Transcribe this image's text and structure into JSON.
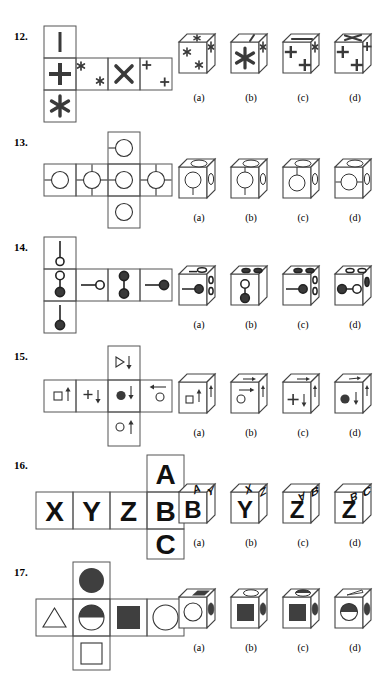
{
  "page": {
    "width": 383,
    "height": 688,
    "background": "#ffffff",
    "ink": "#1a1a1a",
    "gray": "#555555",
    "fill": "#444444"
  },
  "option_labels": [
    "(a)",
    "(b)",
    "(c)",
    "(d)"
  ],
  "problems": [
    {
      "number": "12.",
      "num_x": 14,
      "num_y": 30,
      "net": {
        "x": 44,
        "y": 26,
        "cell": 32,
        "cells": [
          {
            "col": 0,
            "row": 0,
            "glyph": "vertical-bar"
          },
          {
            "col": 0,
            "row": 1,
            "glyph": "plus-bold"
          },
          {
            "col": 0,
            "row": 2,
            "glyph": "asterisk-bold"
          },
          {
            "col": 1,
            "row": 1,
            "glyph": "two-small-asterisks"
          },
          {
            "col": 2,
            "row": 1,
            "glyph": "big-x"
          },
          {
            "col": 3,
            "row": 1,
            "glyph": "two-small-plus"
          }
        ]
      },
      "options": [
        {
          "label": "(a)",
          "x": 175,
          "y": 30,
          "front": "asterisk-pair",
          "top": "small-asterisk",
          "side": "small-asterisk"
        },
        {
          "label": "(b)",
          "x": 227,
          "y": 30,
          "front": "big-asterisk",
          "top": "bar",
          "side": "small-asterisk"
        },
        {
          "label": "(c)",
          "x": 279,
          "y": 30,
          "front": "plus-pair",
          "top": "bar-horizontal",
          "side": "small-asterisk"
        },
        {
          "label": "(d)",
          "x": 331,
          "y": 30,
          "front": "plus-pair",
          "top": "big-x",
          "side": "small-plus"
        }
      ],
      "label_y": 92
    },
    {
      "number": "13.",
      "num_x": 14,
      "num_y": 136,
      "net": {
        "x": 44,
        "y": 132,
        "cell": 32,
        "cells": [
          {
            "col": 2,
            "row": 0,
            "glyph": "circle-left-stub"
          },
          {
            "col": 0,
            "row": 1,
            "glyph": "circle-left-stub"
          },
          {
            "col": 1,
            "row": 1,
            "glyph": "circle-four-stubs"
          },
          {
            "col": 2,
            "row": 1,
            "glyph": "circle-left-stub"
          },
          {
            "col": 3,
            "row": 1,
            "glyph": "circle-four-stubs"
          },
          {
            "col": 2,
            "row": 2,
            "glyph": "circle-plain"
          }
        ],
        "shifted": true
      },
      "options": [
        {
          "label": "(a)",
          "x": 175,
          "y": 155,
          "front": "circle-down-stub",
          "top": "ellipse",
          "side": "ellipse"
        },
        {
          "label": "(b)",
          "x": 227,
          "y": 155,
          "front": "circle-up-down-stub",
          "top": "ellipse",
          "side": "ellipse"
        },
        {
          "label": "(c)",
          "x": 279,
          "y": 155,
          "front": "circle-up-stub",
          "top": "ellipse",
          "side": "ellipse"
        },
        {
          "label": "(d)",
          "x": 331,
          "y": 155,
          "front": "circle-left-right-stub",
          "top": "ellipse",
          "side": "ellipse"
        }
      ],
      "label_y": 212
    },
    {
      "number": "14.",
      "num_x": 14,
      "num_y": 241,
      "net": {
        "x": 44,
        "y": 237,
        "cell": 32,
        "cells": [
          {
            "col": 0,
            "row": 0,
            "glyph": "line-down-open-circle"
          },
          {
            "col": 0,
            "row": 1,
            "glyph": "open-above-filled"
          },
          {
            "col": 1,
            "row": 1,
            "glyph": "line-left-open-circle"
          },
          {
            "col": 2,
            "row": 1,
            "glyph": "filled-above-filled"
          },
          {
            "col": 3,
            "row": 1,
            "glyph": "line-left-filled-circle"
          },
          {
            "col": 0,
            "row": 2,
            "glyph": "line-down-filled-circle"
          }
        ]
      },
      "options": [
        {
          "label": "(a)",
          "x": 175,
          "y": 262,
          "front": "line-filled-right",
          "top": "one-open",
          "side": "two-ellipse"
        },
        {
          "label": "(b)",
          "x": 227,
          "y": 262,
          "front": "open-above-filled-v",
          "top": "two-filled",
          "side": "blank"
        },
        {
          "label": "(c)",
          "x": 279,
          "y": 262,
          "front": "line-filled-right",
          "top": "two-filled",
          "side": "two-ellipse"
        },
        {
          "label": "(d)",
          "x": 331,
          "y": 262,
          "front": "filled-line-open",
          "top": "two-open",
          "side": "one-ellipse"
        }
      ],
      "label_y": 319
    },
    {
      "number": "15.",
      "num_x": 14,
      "num_y": 350,
      "net": {
        "x": 44,
        "y": 346,
        "cell": 32,
        "cells": [
          {
            "col": 2,
            "row": 0,
            "glyph": "triangle-arrow-down"
          },
          {
            "col": 0,
            "row": 1,
            "glyph": "square-arrow-up"
          },
          {
            "col": 1,
            "row": 1,
            "glyph": "plus-arrow-down"
          },
          {
            "col": 2,
            "row": 1,
            "glyph": "dot-arrow-down"
          },
          {
            "col": 3,
            "row": 1,
            "glyph": "circle-arrow-left"
          },
          {
            "col": 2,
            "row": 2,
            "glyph": "circle-arrow-up"
          }
        ],
        "shifted": true
      },
      "options": [
        {
          "label": "(a)",
          "x": 175,
          "y": 370,
          "front": "square-arrow-up",
          "top": "blank",
          "side": "arrow"
        },
        {
          "label": "(b)",
          "x": 227,
          "y": 370,
          "front": "circle-arrow-right",
          "top": "arrow-right",
          "side": "arrow"
        },
        {
          "label": "(c)",
          "x": 279,
          "y": 370,
          "front": "plus-arrow-down",
          "top": "arrow-right",
          "side": "arrow"
        },
        {
          "label": "(d)",
          "x": 331,
          "y": 370,
          "front": "dot-arrow-down",
          "top": "arrow-small",
          "side": "arrow"
        }
      ],
      "label_y": 427
    },
    {
      "number": "16.",
      "num_x": 14,
      "num_y": 459,
      "net": {
        "x": 38,
        "y": 455,
        "cell": 37,
        "cells": [
          {
            "col": 3,
            "row": 0,
            "glyph": "letter",
            "text": "A"
          },
          {
            "col": 0,
            "row": 1,
            "glyph": "letter",
            "text": "X"
          },
          {
            "col": 1,
            "row": 1,
            "glyph": "letter",
            "text": "Y"
          },
          {
            "col": 2,
            "row": 1,
            "glyph": "letter",
            "text": "Z"
          },
          {
            "col": 3,
            "row": 1,
            "glyph": "letter",
            "text": "B"
          },
          {
            "col": 3,
            "row": 2,
            "glyph": "letter",
            "text": "C"
          }
        ],
        "shifted": true
      },
      "options": [
        {
          "label": "(a)",
          "x": 175,
          "y": 480,
          "front": "B",
          "top": "A",
          "side": "Y"
        },
        {
          "label": "(b)",
          "x": 227,
          "y": 480,
          "front": "Y",
          "top": "X",
          "side": "Z"
        },
        {
          "label": "(c)",
          "x": 279,
          "y": 480,
          "front": "Z",
          "top": "A",
          "side": "B"
        },
        {
          "label": "(d)",
          "x": 331,
          "y": 480,
          "front": "Z",
          "top": "B",
          "side": "C"
        }
      ],
      "label_y": 537
    },
    {
      "number": "17.",
      "num_x": 14,
      "num_y": 566,
      "net": {
        "x": 38,
        "y": 562,
        "cell": 37,
        "cells": [
          {
            "col": 1,
            "row": 0,
            "glyph": "filled-circle"
          },
          {
            "col": 0,
            "row": 1,
            "glyph": "triangle"
          },
          {
            "col": 1,
            "row": 1,
            "glyph": "half-filled-circle"
          },
          {
            "col": 2,
            "row": 1,
            "glyph": "filled-square"
          },
          {
            "col": 3,
            "row": 1,
            "glyph": "open-circle"
          },
          {
            "col": 1,
            "row": 2,
            "glyph": "open-square"
          }
        ],
        "shifted": true
      },
      "options": [
        {
          "label": "(a)",
          "x": 175,
          "y": 585,
          "front": "open-circle",
          "top": "filled-rect",
          "side": "filled-ellipse"
        },
        {
          "label": "(b)",
          "x": 227,
          "y": 585,
          "front": "filled-square",
          "top": "open-ellipse",
          "side": "filled-ellipse"
        },
        {
          "label": "(c)",
          "x": 279,
          "y": 585,
          "front": "filled-square",
          "top": "half-ellipse",
          "side": "filled-ellipse"
        },
        {
          "label": "(d)",
          "x": 331,
          "y": 585,
          "front": "half-filled-circle",
          "top": "thin-sliver",
          "side": "filled-ellipse"
        }
      ],
      "label_y": 642
    }
  ]
}
